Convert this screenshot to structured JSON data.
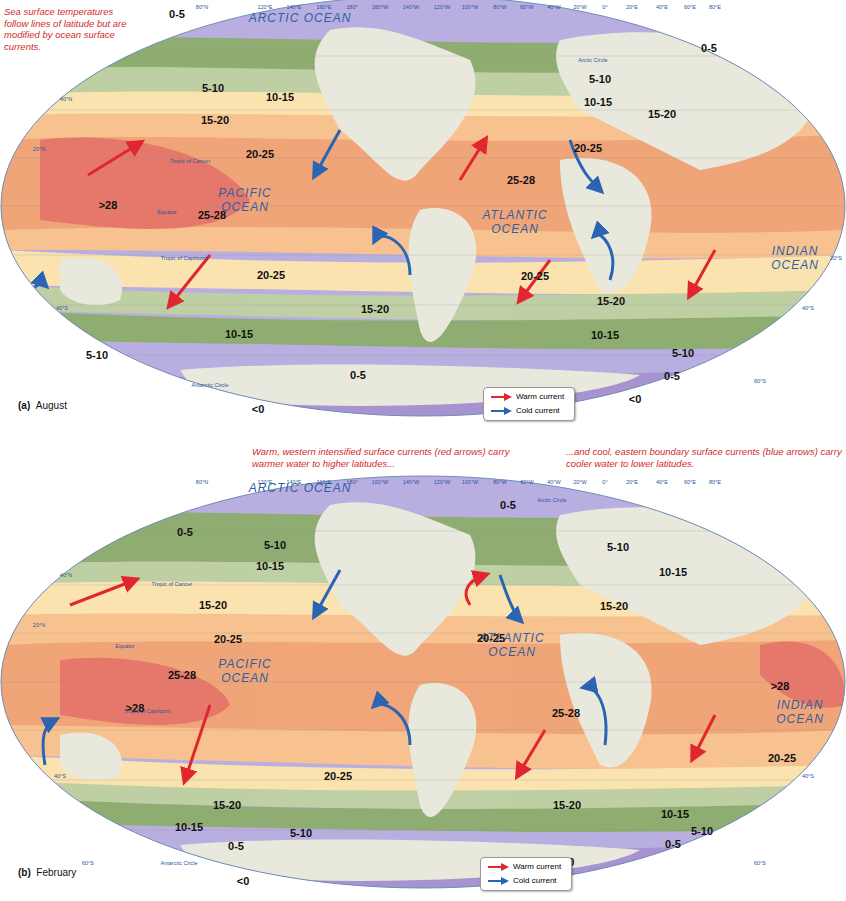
{
  "figure": {
    "intro_note": "Sea surface temperatures follow lines of latitude but are modified by ocean surface currents.",
    "warm_note": "Warm, western intensified surface currents (red arrows) carry warmer water to higher latitudes...",
    "cold_note": "...and cool, eastern boundary  surface currents (blue arrows) carry cooler water to lower latitudes.",
    "colors": {
      "below_0": "#a693cf",
      "0_5": "#b9aee0",
      "5_10": "#8fad72",
      "10_15": "#bfd0a4",
      "15_20": "#fbe3b0",
      "20_25": "#f7c28f",
      "25_28": "#f0a679",
      "above_28": "#e5786c",
      "land": "#e8e9dc",
      "warm_arrow": "#e0262e",
      "cold_arrow": "#2a64b3"
    },
    "longitude_labels": [
      "80°N",
      "120°E",
      "140°E",
      "160°E",
      "180°",
      "160°W",
      "140°W",
      "120°W",
      "100°W",
      "80°W",
      "60°W",
      "40°W",
      "20°W",
      "0°",
      "20°E",
      "40°E",
      "60°E",
      "80°E"
    ],
    "latitude_labels": {
      "n40": "40°N",
      "n20": "20°N",
      "s20": "20°S",
      "s40": "40°S",
      "s60": "60°S",
      "eq": "0°"
    },
    "reference_lines": {
      "arctic_circle": "Arctic Circle",
      "tropic_cancer": "Tropic of Cancer",
      "equator": "Equator",
      "tropic_capricorn": "Tropic of Capricorn",
      "antarctic_circle": "Antarctic Circle"
    }
  },
  "map_a": {
    "caption_letter": "(a)",
    "caption_month": "August",
    "oceans": {
      "arctic": "ARCTIC OCEAN",
      "pacific_1": "PACIFIC",
      "pacific_2": "OCEAN",
      "atlantic_1": "ATLANTIC",
      "atlantic_2": "OCEAN",
      "indian_1": "INDIAN",
      "indian_2": "OCEAN"
    },
    "zones": {
      "z1": "0-5",
      "z2": "0-5",
      "z3": "5-10",
      "z4": "5-10",
      "z5": "10-15",
      "z6": "10-15",
      "z7": "15-20",
      "z8": "15-20",
      "z9": "20-25",
      "z10": "20-25",
      "z11": "25-28",
      "z12": ">28",
      "z13": "25-28",
      "z14": "20-25",
      "z15": "20-25",
      "z16": "15-20",
      "z17": "15-20",
      "z18": "10-15",
      "z19": "10-15",
      "z20": "5-10",
      "z21": "5-10",
      "z22": "0-5",
      "z23": "0-5",
      "z24": "<0",
      "z25": "<0"
    },
    "legend": {
      "warm": "Warm current",
      "cold": "Cold current"
    }
  },
  "map_b": {
    "caption_letter": "(b)",
    "caption_month": "February",
    "oceans": {
      "arctic": "ARCTIC OCEAN",
      "pacific_1": "PACIFIC",
      "pacific_2": "OCEAN",
      "atlantic_1": "ATLANTIC",
      "atlantic_2": "OCEAN",
      "indian_1": "INDIAN",
      "indian_2": "OCEAN"
    },
    "zones": {
      "z1": "0-5",
      "z2": "0-5",
      "z3": "5-10",
      "z4": "5-10",
      "z5": "10-15",
      "z6": "10-15",
      "z7": "15-20",
      "z8": "15-20",
      "z9": "20-25",
      "z10": "20-25",
      "z11": "25-28",
      "z12": ">28",
      "z13": "25-28",
      "z14": ">28",
      "z15": "20-25",
      "z16": "20-25",
      "z17": "15-20",
      "z18": "15-20",
      "z19": "10-15",
      "z20": "10-15",
      "z21": "5-10",
      "z22": "5-10",
      "z23": "0-5",
      "z24": "0-5",
      "z25": "<0",
      "z26": "<0"
    },
    "legend": {
      "warm": "Warm current",
      "cold": "Cold current"
    }
  }
}
